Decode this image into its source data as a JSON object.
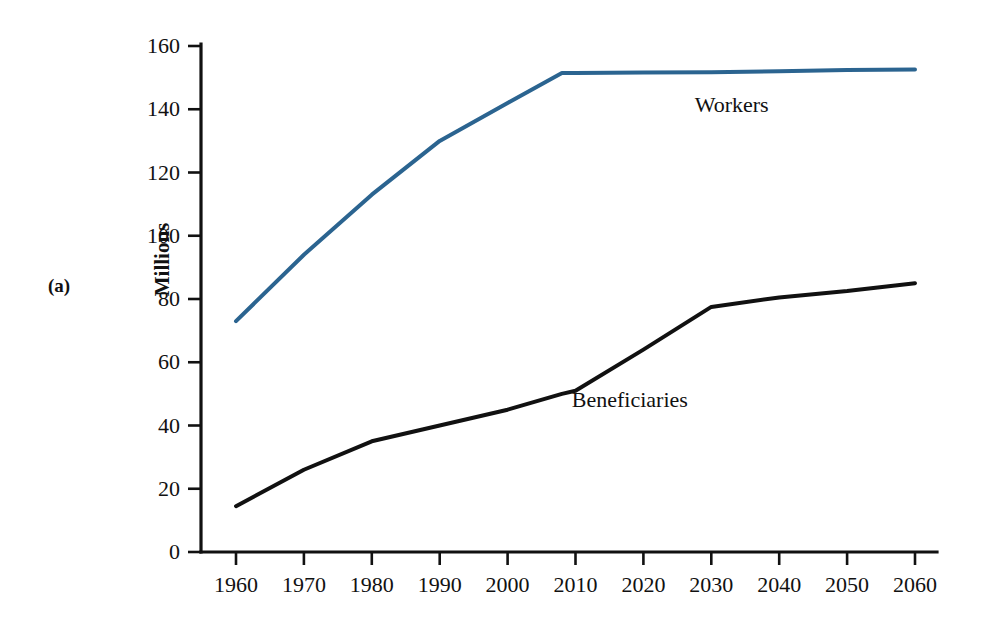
{
  "figure": {
    "panel_label": "(a)",
    "y_axis_title": "Millions",
    "background_color": "#ffffff"
  },
  "chart_data": {
    "type": "line",
    "title": "",
    "subtitle": "",
    "xlabel": "",
    "ylabel": "Millions",
    "xlim": [
      1955,
      2063
    ],
    "ylim": [
      0,
      168
    ],
    "grid": false,
    "legend_position": "inline-annotation",
    "x_tick_labels": [
      "1960",
      "1970",
      "1980",
      "1990",
      "2000",
      "2010",
      "2020",
      "2030",
      "2040",
      "2050",
      "2060"
    ],
    "y_tick_labels": [
      "0",
      "20",
      "40",
      "60",
      "80",
      "100",
      "120",
      "140",
      "160"
    ],
    "x_ticks": [
      1960,
      1970,
      1980,
      1990,
      2000,
      2010,
      2020,
      2030,
      2040,
      2050,
      2060
    ],
    "y_ticks": [
      0,
      20,
      40,
      60,
      80,
      100,
      120,
      140,
      160
    ],
    "x": [
      1960,
      1970,
      1980,
      1990,
      2000,
      2008,
      2010,
      2020,
      2030,
      2040,
      2050,
      2060
    ],
    "series": [
      {
        "name": "Workers",
        "color": "#2b6490",
        "label_text": "Workers",
        "label_x": 2033,
        "label_y": 139,
        "line_width": 4.0,
        "values": [
          73,
          94,
          113,
          130,
          142,
          151.5,
          151.5,
          151.6,
          151.7,
          152.0,
          152.4,
          152.6
        ]
      },
      {
        "name": "Beneficiaries",
        "color": "#111111",
        "label_text": "Beneficiaries",
        "label_x": 2018,
        "label_y": 46,
        "line_width": 4.0,
        "values": [
          14.5,
          26,
          35,
          40,
          45,
          50,
          51,
          64,
          77.5,
          80.5,
          82.5,
          85
        ]
      }
    ],
    "annotations": [
      {
        "text": "Workers",
        "x": 2033,
        "y": 139
      },
      {
        "text": "Beneficiaries",
        "x": 2018,
        "y": 46
      }
    ]
  }
}
